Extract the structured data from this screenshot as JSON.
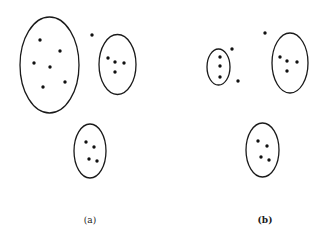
{
  "style": {
    "stroke": "#1a1a1a",
    "dot": "#111111",
    "background": "#ffffff"
  },
  "panels": [
    {
      "id": "a",
      "label": "(a)",
      "label_pos": [
        90,
        223
      ],
      "clusters": [
        {
          "name": "large-cluster",
          "cx": 49.5,
          "cy": 65,
          "rx": 29.5,
          "ry": 48,
          "points": [
            [
              40,
              40
            ],
            [
              60,
              51
            ],
            [
              34,
              63
            ],
            [
              50,
              67
            ],
            [
              43,
              87
            ],
            [
              65,
              82
            ]
          ]
        },
        {
          "name": "right-cluster",
          "cx": 117.5,
          "cy": 64.5,
          "rx": 18.5,
          "ry": 30,
          "points": [
            [
              108,
              58
            ],
            [
              115,
              62
            ],
            [
              124,
              63
            ],
            [
              115,
              72
            ]
          ]
        },
        {
          "name": "bottom-cluster",
          "cx": 90,
          "cy": 151,
          "rx": 16,
          "ry": 27,
          "points": [
            [
              86,
              142
            ],
            [
              94,
              147
            ],
            [
              89,
              159
            ],
            [
              97,
              161
            ]
          ]
        }
      ],
      "outliers": [
        [
          92,
          35
        ]
      ]
    },
    {
      "id": "b",
      "label": "(b)",
      "label_pos": [
        265,
        223
      ],
      "clusters": [
        {
          "name": "small-left-cluster",
          "cx": 218.5,
          "cy": 67,
          "rx": 11.5,
          "ry": 18,
          "points": [
            [
              220,
              57
            ],
            [
              220,
              66
            ],
            [
              220,
              77
            ]
          ]
        },
        {
          "name": "right-cluster",
          "cx": 290,
          "cy": 63,
          "rx": 18,
          "ry": 30,
          "points": [
            [
              280,
              57
            ],
            [
              287,
              61
            ],
            [
              297,
              62
            ],
            [
              287,
              71
            ]
          ]
        },
        {
          "name": "bottom-cluster",
          "cx": 262.5,
          "cy": 150,
          "rx": 16.5,
          "ry": 27,
          "points": [
            [
              258,
              141
            ],
            [
              267,
              146
            ],
            [
              261,
              157
            ],
            [
              269,
              160
            ]
          ]
        }
      ],
      "outliers": [
        [
          232,
          49
        ],
        [
          238,
          81
        ],
        [
          265,
          33
        ]
      ]
    }
  ]
}
